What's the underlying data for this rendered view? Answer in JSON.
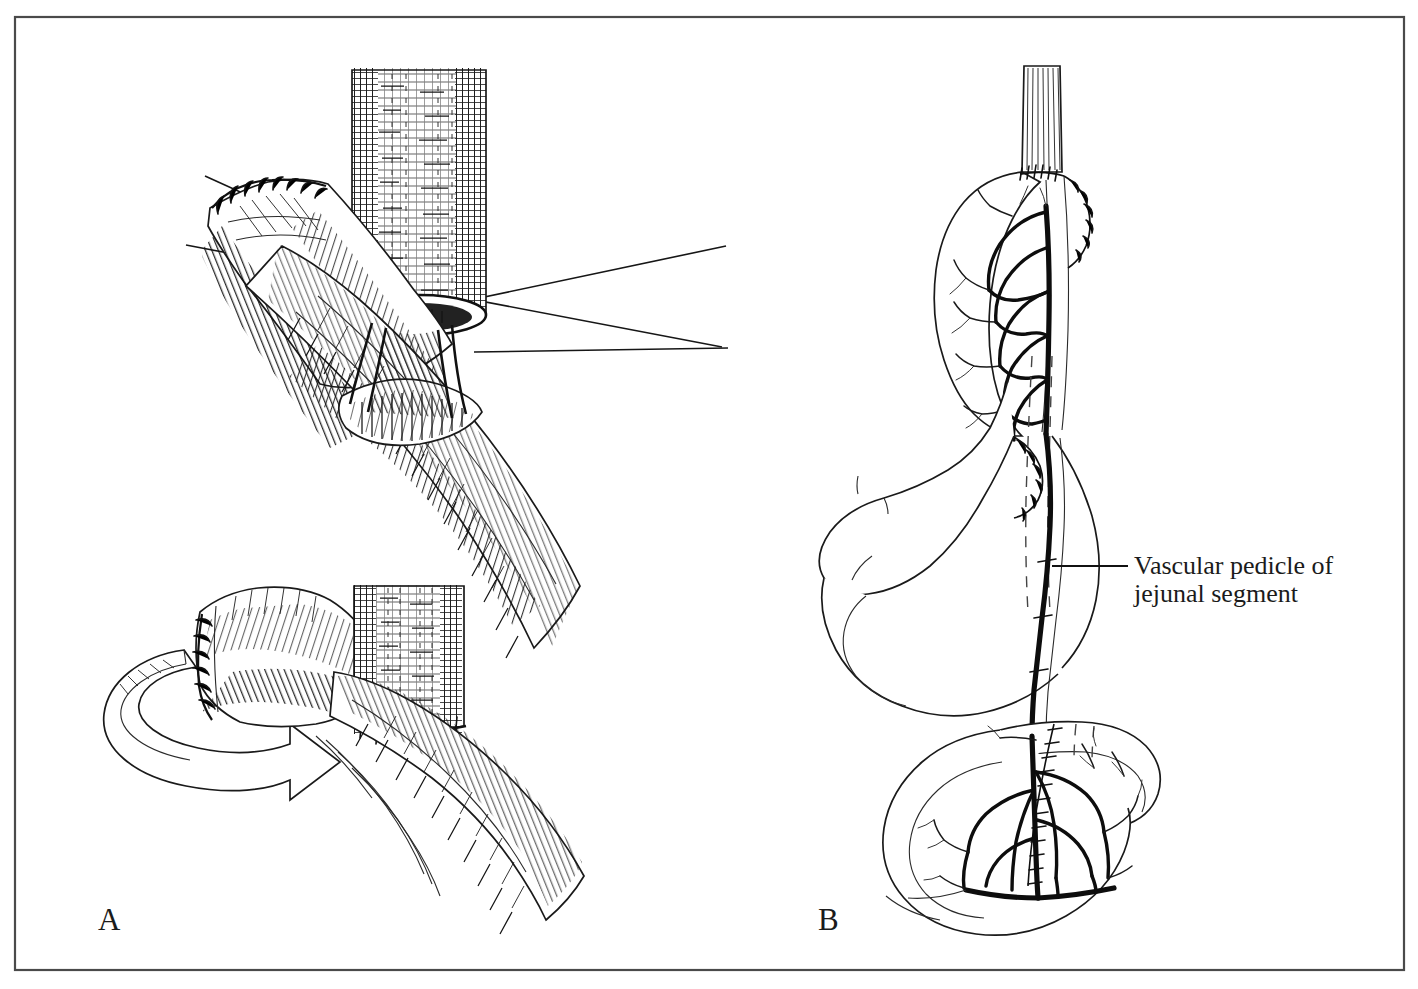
{
  "figure": {
    "kind": "surgical-line-illustration",
    "medium": "pen-and-ink cross-hatch drawing",
    "background_color": "#ffffff",
    "ink_color": "#111111",
    "frame": {
      "present": true,
      "color": "#4a4a4a",
      "x": 15,
      "y": 17,
      "width": 1389,
      "height": 953
    },
    "panels": [
      {
        "id": "A",
        "letter": "A",
        "letter_x": 98,
        "letter_y": 930,
        "description": "Two-stage detail of jejunal segment anastomosis to the esophagus",
        "subpanels": [
          {
            "id": "A-top",
            "description": "Cut end of esophagus with open lumen sutured to opened jejunal loop; two long traction suture threads sweep across the field"
          },
          {
            "id": "A-bottom",
            "description": "Completed rotation: jejunal segment swung around and stapled-sutured to the esophageal stump, curved 3-D ribbon arrow shows direction of rotation"
          }
        ]
      },
      {
        "id": "B",
        "letter": "B",
        "letter_x": 818,
        "letter_y": 930,
        "description": "Overview of completed free jejunal interposition between esophagus and stomach, with mesenteric vascular arcade",
        "structures": [
          "esophagus",
          "jejunal interposition segment",
          "mesenteric vascular arcade",
          "stomach",
          "distal jejunal loop",
          "retrogastric tunnel (dashed)"
        ]
      }
    ],
    "callouts": [
      {
        "id": "vascular-pedicle",
        "line1": "Vascular pedicle of",
        "line2": "jejunal segment",
        "text_x": 1134,
        "line1_y": 566,
        "line2_y": 594,
        "leader": {
          "x1": 1052,
          "y1": 566,
          "x2": 1128,
          "y2": 566
        }
      }
    ],
    "annotation_features": {
      "arrow_label": "rotation-arrow",
      "dashed_meaning": "retrogastric tunnel / hidden segment",
      "suture_marks": "interrupted anastomotic stitches"
    }
  }
}
